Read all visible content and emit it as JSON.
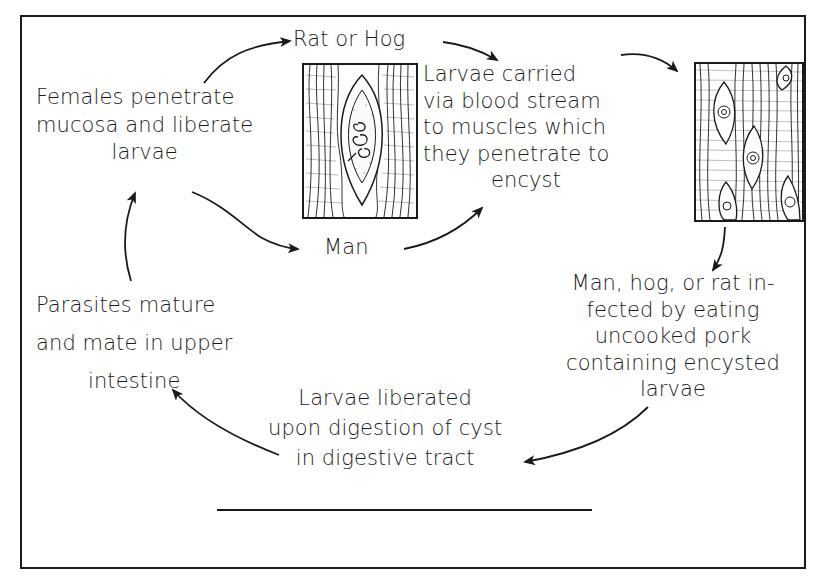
{
  "diagram": {
    "title": "",
    "type": "life-cycle",
    "nodes": [
      {
        "id": "rat_or_hog",
        "lines": [
          "Rat or Hog"
        ]
      },
      {
        "id": "females",
        "lines": [
          "Females penetrate",
          "mucosa  and liberate",
          "larvae"
        ]
      },
      {
        "id": "larvae_carried",
        "lines": [
          "Larvae carried",
          "via blood stream",
          "to muscles which",
          "they penetrate to",
          "encyst"
        ]
      },
      {
        "id": "man",
        "lines": [
          "Man"
        ]
      },
      {
        "id": "infected",
        "lines": [
          "Man, hog, or  rat in-",
          "fected by eating",
          "uncooked pork",
          "containing  encysted",
          "larvae"
        ]
      },
      {
        "id": "parasites",
        "lines": [
          "Parasites  mature",
          "and  mate in upper",
          "intestine"
        ]
      },
      {
        "id": "liberated",
        "lines": [
          "Larvae  liberated",
          "upon digestion of cyst",
          "in digestive tract"
        ]
      }
    ],
    "illustrations": [
      {
        "id": "cyst-single",
        "description": "muscle tissue with single encysted coiled larva"
      },
      {
        "id": "cyst-multiple",
        "description": "muscle tissue with multiple encysted larvae"
      }
    ],
    "edges": [
      {
        "from": "females",
        "to": "rat_or_hog"
      },
      {
        "from": "females",
        "to": "man"
      },
      {
        "from": "rat_or_hog",
        "to": "larvae_carried"
      },
      {
        "from": "man",
        "to": "larvae_carried"
      },
      {
        "from": "larvae_carried",
        "to": "cyst-multiple"
      },
      {
        "from": "cyst-multiple",
        "to": "infected"
      },
      {
        "from": "infected",
        "to": "liberated"
      },
      {
        "from": "liberated",
        "to": "parasites"
      },
      {
        "from": "parasites",
        "to": "females"
      }
    ],
    "colors": {
      "ink": "#1a1a1a",
      "paper": "#ffffff"
    }
  }
}
